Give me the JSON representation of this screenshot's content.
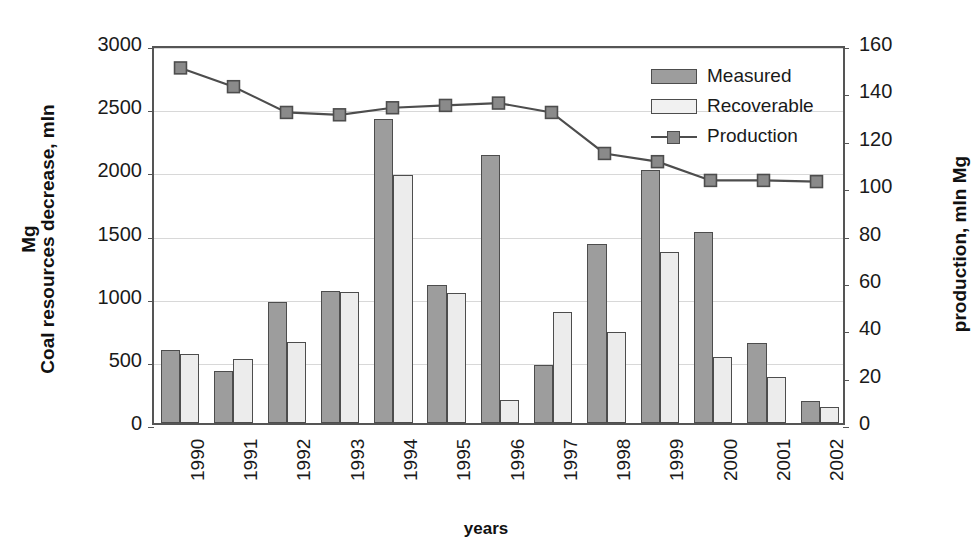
{
  "chart_data": {
    "type": "bar",
    "title": "",
    "xlabel": "years",
    "ylabel": "Coal resources decrease, mln Mg",
    "ylabel_line1": "Coal resources decrease, mln",
    "ylabel_line2": "Mg",
    "y2label": "production, mln Mg",
    "categories": [
      "1990",
      "1991",
      "1992",
      "1993",
      "1994",
      "1995",
      "1996",
      "1997",
      "1998",
      "1999",
      "2000",
      "2001",
      "2002"
    ],
    "ylim": [
      0,
      3000
    ],
    "yticks": [
      0,
      500,
      1000,
      1500,
      2000,
      2500,
      3000
    ],
    "y2lim": [
      0,
      160
    ],
    "y2ticks": [
      0,
      20,
      40,
      60,
      80,
      100,
      120,
      140,
      160
    ],
    "grid": true,
    "legend_position": "top-right",
    "series": [
      {
        "name": "Measured",
        "type": "bar",
        "axis": "left",
        "color": "#9d9d9d",
        "values": [
          575,
          415,
          955,
          1045,
          2410,
          1095,
          2125,
          460,
          1415,
          2000,
          1510,
          635,
          175
        ]
      },
      {
        "name": "Recoverable",
        "type": "bar",
        "axis": "left",
        "color": "#ececec",
        "values": [
          550,
          505,
          640,
          1040,
          1960,
          1030,
          180,
          880,
          720,
          1355,
          525,
          365,
          130
        ]
      },
      {
        "name": "Production",
        "type": "line",
        "axis": "right",
        "color": "#4d4d4d",
        "values": [
          151.5,
          143.5,
          132.5,
          131.5,
          134.5,
          135.5,
          136.5,
          132.5,
          115.0,
          111.5,
          103.5,
          103.5,
          103.0
        ]
      }
    ]
  },
  "legend": {
    "items": [
      {
        "label": "Measured",
        "marker": "bar-dark"
      },
      {
        "label": "Recoverable",
        "marker": "bar-light"
      },
      {
        "label": "Production",
        "marker": "line-square"
      }
    ]
  }
}
